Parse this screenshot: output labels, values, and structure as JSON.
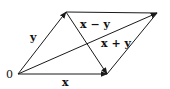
{
  "diagram": {
    "origin_label": "0",
    "vectors": [
      {
        "id": "x",
        "label": "x",
        "from": [
          18,
          74
        ],
        "to": [
          107,
          74
        ],
        "label_pos": [
          62,
          86
        ]
      },
      {
        "id": "y",
        "label": "y",
        "from": [
          18,
          74
        ],
        "to": [
          66,
          12
        ],
        "label_pos": [
          30,
          41
        ]
      },
      {
        "id": "x_plus_y",
        "label": "x + y",
        "from": [
          18,
          74
        ],
        "to": [
          157,
          13
        ],
        "label_pos": [
          101,
          47
        ]
      },
      {
        "id": "x_minus_y",
        "label": "x − y",
        "from": [
          66,
          12
        ],
        "to": [
          107,
          74
        ],
        "label_pos": [
          80,
          28
        ]
      }
    ],
    "edges": [
      {
        "id": "top_edge",
        "from": [
          66,
          12
        ],
        "to": [
          157,
          13
        ]
      },
      {
        "id": "right_edge",
        "from": [
          107,
          74
        ],
        "to": [
          157,
          13
        ]
      }
    ],
    "colors": {
      "stroke": "#1a1a1a",
      "text": "#111111",
      "background": "#ffffff"
    }
  }
}
